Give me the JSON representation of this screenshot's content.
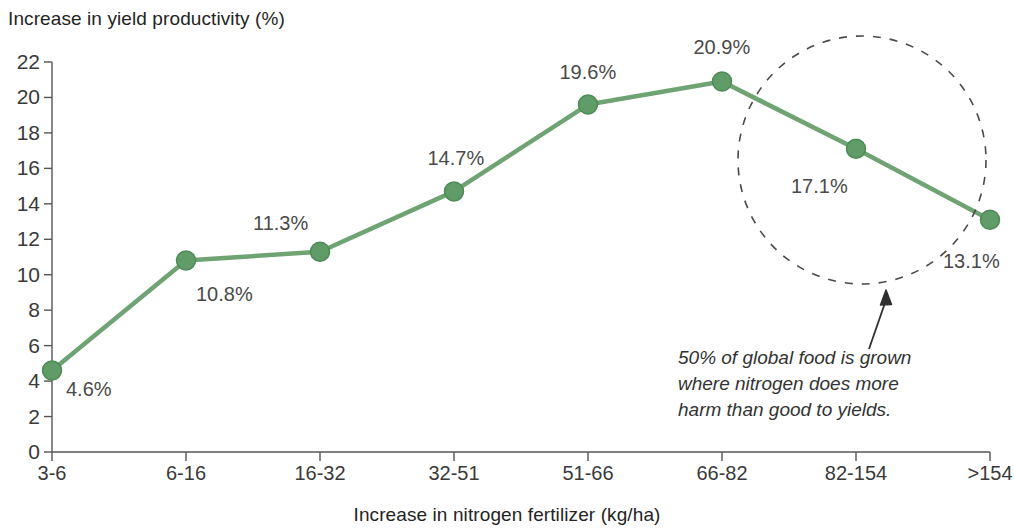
{
  "chart_data": {
    "type": "line",
    "title": "",
    "ylabel": "Increase in yield productivity (%)",
    "xlabel": "Increase in nitrogen fertilizer (kg/ha)",
    "categories": [
      "3-6",
      "6-16",
      "16-32",
      "32-51",
      "51-66",
      "66-82",
      "82-154",
      ">154"
    ],
    "values": [
      4.6,
      10.8,
      11.3,
      14.7,
      19.6,
      20.9,
      17.1,
      13.1
    ],
    "point_labels": [
      "4.6%",
      "10.8%",
      "11.3%",
      "14.7%",
      "19.6%",
      "20.9%",
      "17.1%",
      "13.1%"
    ],
    "ylim": [
      0,
      22
    ],
    "yticks": [
      0,
      2,
      4,
      6,
      8,
      10,
      12,
      14,
      16,
      18,
      20,
      22
    ],
    "ytick_labels": [
      "0",
      "2",
      "4",
      "6",
      "8",
      "10",
      "12",
      "14",
      "16",
      "18",
      "20",
      "22"
    ],
    "grid": false,
    "legend": "none",
    "series_color": "#6fa373",
    "marker_color": "#5f9c68",
    "marker_edge_color": "#4f8a58",
    "annotation": {
      "lines": [
        "50% of global food is grown",
        "where nitrogen does more",
        "harm than good to yields."
      ],
      "highlight_shape": "dashed-circle",
      "highlight_covers": [
        "66-82",
        "82-154",
        ">154"
      ]
    }
  }
}
